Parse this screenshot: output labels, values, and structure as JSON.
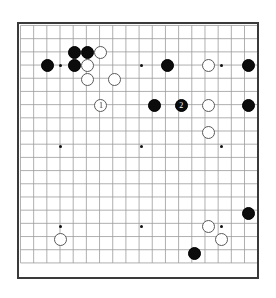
{
  "board": {
    "type": "go-board",
    "size": 19,
    "origin_x": 17,
    "origin_y": 22,
    "spacing": 13.4,
    "stone_radius": 6.6,
    "grid_color": "#9a9a9a",
    "border_color": "#3a3a3a",
    "background": "#ffffff",
    "black_color": "#0c0c0c",
    "white_color": "#ffffff",
    "white_edge": "#5a5a5a",
    "star_points": [
      {
        "col": 3,
        "row": 3
      },
      {
        "col": 9,
        "row": 3
      },
      {
        "col": 15,
        "row": 3
      },
      {
        "col": 3,
        "row": 9
      },
      {
        "col": 9,
        "row": 9
      },
      {
        "col": 15,
        "row": 9
      },
      {
        "col": 3,
        "row": 15
      },
      {
        "col": 9,
        "row": 15
      },
      {
        "col": 15,
        "row": 15
      }
    ],
    "stones": [
      {
        "color": "black",
        "col": 4,
        "row": 2,
        "label": ""
      },
      {
        "color": "black",
        "col": 5,
        "row": 2,
        "label": ""
      },
      {
        "color": "white",
        "col": 6,
        "row": 2,
        "label": ""
      },
      {
        "color": "black",
        "col": 2,
        "row": 3,
        "label": ""
      },
      {
        "color": "black",
        "col": 4,
        "row": 3,
        "label": ""
      },
      {
        "color": "white",
        "col": 5,
        "row": 3,
        "label": ""
      },
      {
        "color": "black",
        "col": 11,
        "row": 3,
        "label": ""
      },
      {
        "color": "white",
        "col": 14,
        "row": 3,
        "label": ""
      },
      {
        "color": "black",
        "col": 17,
        "row": 3,
        "label": ""
      },
      {
        "color": "white",
        "col": 5,
        "row": 4,
        "label": ""
      },
      {
        "color": "white",
        "col": 7,
        "row": 4,
        "label": ""
      },
      {
        "color": "white",
        "col": 6,
        "row": 6,
        "label": "1"
      },
      {
        "color": "black",
        "col": 10,
        "row": 6,
        "label": ""
      },
      {
        "color": "black",
        "col": 12,
        "row": 6,
        "label": "2"
      },
      {
        "color": "white",
        "col": 14,
        "row": 6,
        "label": ""
      },
      {
        "color": "black",
        "col": 17,
        "row": 6,
        "label": ""
      },
      {
        "color": "white",
        "col": 14,
        "row": 8,
        "label": ""
      },
      {
        "color": "black",
        "col": 17,
        "row": 14,
        "label": ""
      },
      {
        "color": "white",
        "col": 14,
        "row": 15,
        "label": ""
      },
      {
        "color": "white",
        "col": 15,
        "row": 16,
        "label": ""
      },
      {
        "color": "white",
        "col": 3,
        "row": 16,
        "label": ""
      },
      {
        "color": "black",
        "col": 13,
        "row": 17,
        "label": ""
      }
    ]
  }
}
